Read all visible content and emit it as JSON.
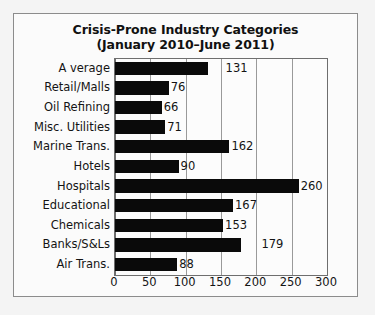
{
  "chart_data": {
    "type": "bar",
    "orientation": "horizontal",
    "title": "Crisis-Prone Industry Categories",
    "subtitle": "(January 2010–June 2011)",
    "xlabel": "",
    "ylabel": "",
    "xlim": [
      0,
      300
    ],
    "xticks": [
      0,
      50,
      100,
      150,
      200,
      250,
      300
    ],
    "grid": "vertical",
    "legend": "none",
    "bar_color": "#0a0a0a",
    "categories": [
      "A verage",
      "Retail/Malls",
      "Oil Refining",
      "Misc. Utilities",
      "Marine Trans.",
      "Hotels",
      "Hospitals",
      "Educational",
      "Chemicals",
      "Banks/S&Ls",
      "Air Trans."
    ],
    "values": [
      131,
      76,
      66,
      71,
      162,
      90,
      260,
      167,
      153,
      179,
      88
    ],
    "data_labels": [
      "131",
      "76",
      "66",
      "71",
      "162",
      "90",
      "260",
      "167",
      "153",
      "179",
      "88"
    ],
    "label_offsets": [
      18,
      2,
      2,
      2,
      2,
      2,
      2,
      2,
      2,
      20,
      2
    ]
  }
}
